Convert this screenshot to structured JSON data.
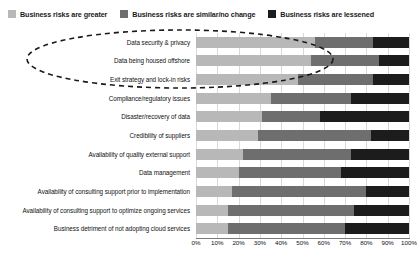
{
  "legend": {
    "position": "top-left",
    "items": [
      {
        "label": "Business risks are greater",
        "color": "#b8b8b8",
        "key": "greater"
      },
      {
        "label": "Business risks are similar/no change",
        "color": "#6e6e6e",
        "key": "similar"
      },
      {
        "label": "Business risks are lessened",
        "color": "#1c1c1c",
        "key": "lessened"
      }
    ]
  },
  "annotation": {
    "type": "dashed-ellipse",
    "color": "#1a1a1a",
    "covers": [
      "Data security & privacy",
      "Data being housed offshore",
      "Exit strategy and lock-in risks"
    ]
  },
  "chart_data": {
    "type": "bar",
    "orientation": "horizontal",
    "stacked": true,
    "stack_mode": "percent",
    "title": "",
    "subtitle": "",
    "xlabel": "",
    "ylabel": "",
    "xlim": [
      0,
      100
    ],
    "grid": true,
    "legend_position": "top-left",
    "xticks": [
      "0%",
      "10%",
      "20%",
      "30%",
      "40%",
      "50%",
      "60%",
      "70%",
      "80%",
      "90%",
      "100%"
    ],
    "xtick_values": [
      0,
      10,
      20,
      30,
      40,
      50,
      60,
      70,
      80,
      90,
      100
    ],
    "categories": [
      "Data security & privacy",
      "Data being housed offshore",
      "Exit strategy and lock-in risks",
      "Compliance/regulatory issues",
      "Disaster/recovery of data",
      "Credibility of suppliers",
      "Availability of quality external support",
      "Data management",
      "Availability of consulting support prior to implementation",
      "Availability of consulting support to optimize ongoing services",
      "Business detriment of not adopting cloud services"
    ],
    "series": [
      {
        "name": "Business risks are greater",
        "color": "#b8b8b8",
        "values": [
          56,
          54,
          48,
          35,
          31,
          29,
          22,
          20,
          17,
          15,
          15
        ]
      },
      {
        "name": "Business risks are similar/no change",
        "color": "#6e6e6e",
        "values": [
          27,
          32,
          35,
          38,
          27,
          53,
          51,
          48,
          63,
          59,
          55
        ]
      },
      {
        "name": "Business risks are lessened",
        "color": "#1c1c1c",
        "values": [
          17,
          14,
          17,
          27,
          42,
          18,
          27,
          32,
          20,
          26,
          30
        ]
      }
    ]
  }
}
